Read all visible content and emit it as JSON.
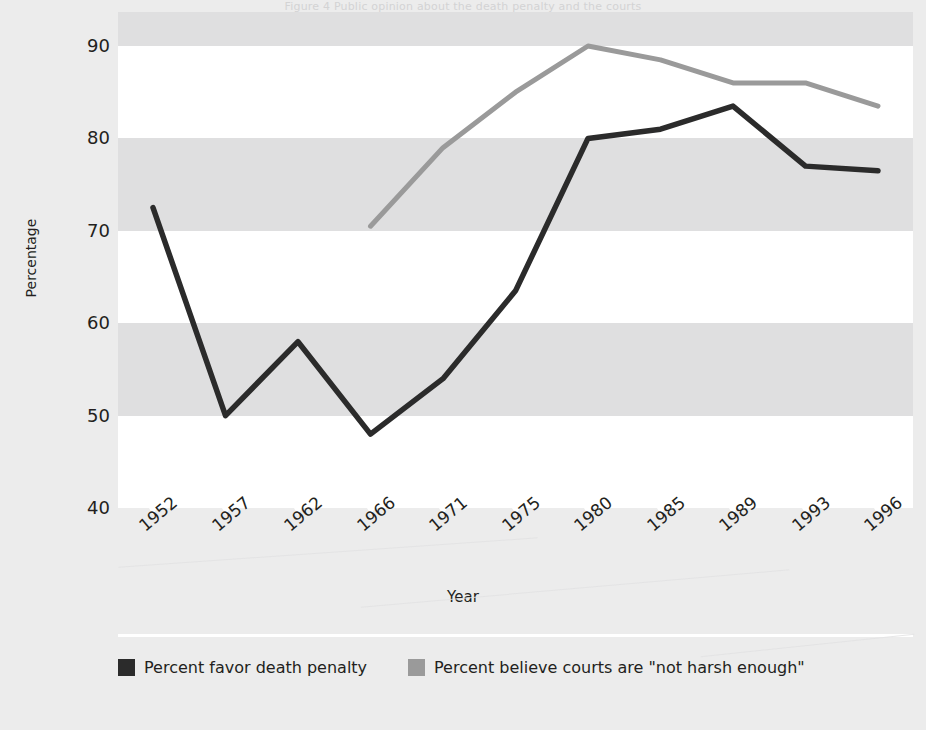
{
  "figure": {
    "background_color": "#ececec",
    "plot_background_color": "#dfdfe0",
    "band_color": "#ffffff",
    "title_faint": "Figure 4  Public opinion about the death penalty and the courts"
  },
  "axes": {
    "ylabel": "Percentage",
    "xlabel": "Year",
    "yticks": [
      90,
      80,
      70,
      60,
      50,
      40
    ],
    "ytick_labels": [
      "90",
      "80",
      "70",
      "60",
      "50",
      "40"
    ],
    "xtick_labels": [
      "1952",
      "1957",
      "1962",
      "1966",
      "1971",
      "1975",
      "1980",
      "1985",
      "1989",
      "1993",
      "1996"
    ]
  },
  "legend": {
    "items": [
      {
        "label": "Percent favor death penalty",
        "color": "#2b2b2b"
      },
      {
        "label": "Percent believe courts are \"not harsh enough\"",
        "color": "#9a9a9a"
      }
    ]
  },
  "chart_data": {
    "type": "line",
    "title": "",
    "xlabel": "Year",
    "ylabel": "Percentage",
    "ylim": [
      40,
      90
    ],
    "grid": true,
    "legend_position": "bottom",
    "categories": [
      "1952",
      "1957",
      "1962",
      "1966",
      "1971",
      "1975",
      "1980",
      "1985",
      "1989",
      "1993",
      "1996"
    ],
    "series": [
      {
        "name": "Percent favor death penalty",
        "color": "#2b2b2b",
        "values": [
          72.5,
          50.0,
          58.0,
          48.0,
          54.0,
          63.5,
          80.0,
          81.0,
          83.5,
          77.0,
          76.5
        ]
      },
      {
        "name": "Percent believe courts are \"not harsh enough\"",
        "color": "#9a9a9a",
        "values": [
          null,
          null,
          null,
          70.5,
          79.0,
          85.0,
          90.0,
          88.5,
          86.0,
          86.0,
          83.5
        ]
      }
    ]
  }
}
